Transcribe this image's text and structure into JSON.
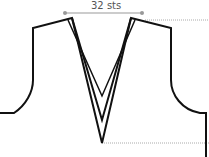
{
  "diagram": {
    "type": "knitting-schematic",
    "measurement_label": "32 sts",
    "colors": {
      "outline": "#111111",
      "measure_line": "#999999",
      "dotted_guide": "#aaaaaa",
      "label": "#555555"
    }
  }
}
